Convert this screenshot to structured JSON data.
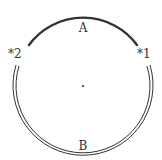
{
  "diagram": {
    "labels": {
      "arc_a": "A",
      "arc_b": "B",
      "point_1": "*1",
      "point_2": "*2"
    },
    "colors": {
      "stroke": "#333333",
      "background": "#ffffff"
    },
    "circle": {
      "cx": 83,
      "cy": 86,
      "r": 67
    }
  }
}
